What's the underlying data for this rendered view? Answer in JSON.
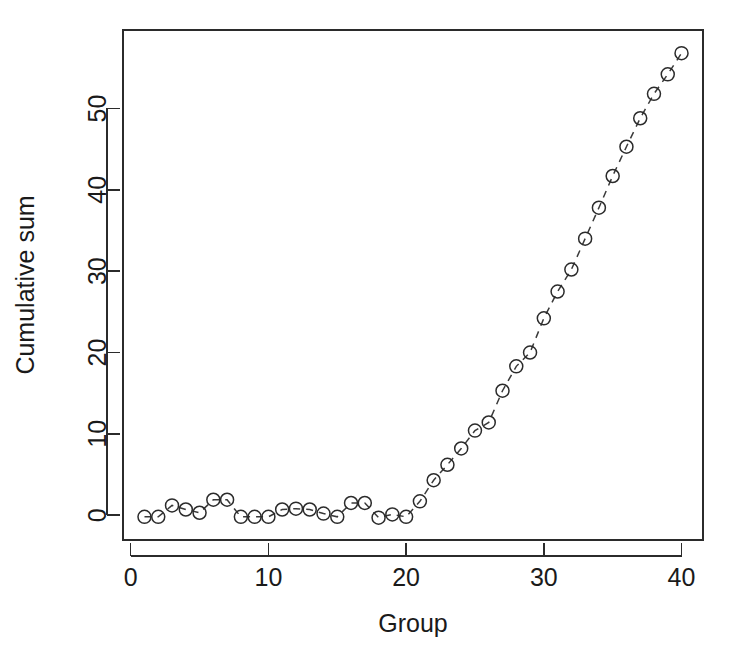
{
  "chart_data": {
    "type": "scatter",
    "title": "",
    "subtitle": "",
    "xlabel": "Group",
    "ylabel": "Cumulative sum",
    "x": [
      1,
      2,
      3,
      4,
      5,
      6,
      7,
      8,
      9,
      10,
      11,
      12,
      13,
      14,
      15,
      16,
      17,
      18,
      19,
      20,
      21,
      22,
      23,
      24,
      25,
      26,
      27,
      28,
      29,
      30,
      31,
      32,
      33,
      34,
      35,
      36,
      37,
      38,
      39,
      40
    ],
    "values": [
      -0.2,
      -0.2,
      1.2,
      0.7,
      0.3,
      1.9,
      1.9,
      -0.2,
      -0.2,
      -0.2,
      0.7,
      0.8,
      0.7,
      0.2,
      -0.2,
      1.5,
      1.5,
      -0.3,
      0.1,
      -0.2,
      1.7,
      4.3,
      6.2,
      8.2,
      10.4,
      11.4,
      15.3,
      18.3,
      20.0,
      24.2,
      27.5,
      30.2,
      34.0,
      37.8,
      41.7,
      45.3,
      48.8,
      51.8,
      54.2,
      56.8
    ],
    "series": [
      {
        "name": "Cumulative sum",
        "values": [
          -0.2,
          -0.2,
          1.2,
          0.7,
          0.3,
          1.9,
          1.9,
          -0.2,
          -0.2,
          -0.2,
          0.7,
          0.8,
          0.7,
          0.2,
          -0.2,
          1.5,
          1.5,
          -0.3,
          0.1,
          -0.2,
          1.7,
          4.3,
          6.2,
          8.2,
          10.4,
          11.4,
          15.3,
          18.3,
          20.0,
          24.2,
          27.5,
          30.2,
          34.0,
          37.8,
          41.7,
          45.3,
          48.8,
          51.8,
          54.2,
          56.8
        ],
        "marker": "open-circle",
        "linestyle": "dashed"
      }
    ],
    "xlim": [
      -0.56,
      41.56
    ],
    "ylim": [
      -3.05,
      59.65
    ],
    "xticks": [
      0,
      10,
      20,
      30,
      40
    ],
    "yticks": [
      0,
      10,
      20,
      30,
      40,
      50
    ],
    "xtick_labels": [
      "0",
      "10",
      "20",
      "30",
      "40"
    ],
    "ytick_labels": [
      "0",
      "10",
      "20",
      "30",
      "40",
      "50"
    ],
    "grid": false,
    "legend": false,
    "legend_position": "none",
    "point_color": "#2b2b2b",
    "line_color": "#3a3a3a",
    "background": "#ffffff"
  }
}
